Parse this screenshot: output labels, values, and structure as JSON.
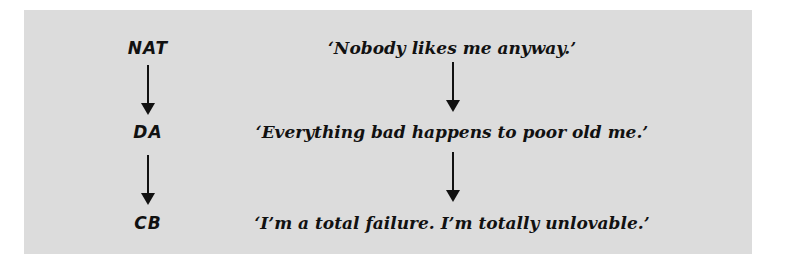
{
  "diagram": {
    "background_color": "#dcdcdc",
    "text_color": "#111111",
    "left_column": [
      {
        "label": "NAT"
      },
      {
        "label": "DA"
      },
      {
        "label": "CB"
      }
    ],
    "right_column": [
      {
        "label": "‘Nobody likes me anyway.’"
      },
      {
        "label": "‘Everything bad happens to poor old me.’"
      },
      {
        "label": "‘I’m a total failure. I’m totally unlovable.’"
      }
    ],
    "arrows": [
      {
        "from": "NAT",
        "to": "DA"
      },
      {
        "from": "DA",
        "to": "CB"
      },
      {
        "from": "‘Nobody likes me anyway.’",
        "to": "‘Everything bad happens to poor old me.’"
      },
      {
        "from": "‘Everything bad happens to poor old me.’",
        "to": "‘I’m a total failure. I’m totally unlovable.’"
      }
    ]
  }
}
